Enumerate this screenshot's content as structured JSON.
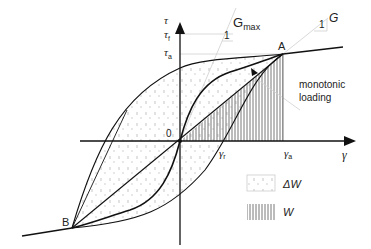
{
  "diagram": {
    "type": "hysteresis-loop",
    "axes": {
      "x_label": "γ",
      "y_label": "τ",
      "origin_label": "0"
    },
    "y_ticks": {
      "tau_f": "τf",
      "tau_a": "τa",
      "tau_f_main": "τ",
      "tau_f_sub": "f",
      "tau_a_main": "τ",
      "tau_a_sub": "a"
    },
    "x_ticks": {
      "gamma_r_main": "γ",
      "gamma_r_sub": "r",
      "gamma_a_main": "γ",
      "gamma_a_sub": "a"
    },
    "points": {
      "A": "A",
      "B": "B"
    },
    "slopes": {
      "gmax_main": "G",
      "gmax_sub": "max",
      "gmax_unit": "1",
      "g_label": "G",
      "g_unit": "1"
    },
    "annotations": {
      "monotonic_line1": "monotonic",
      "monotonic_line2": "loading"
    },
    "legend": {
      "items": [
        {
          "label": "ΔW",
          "pattern": "dotted"
        },
        {
          "label": "W",
          "pattern": "vertical-hatch"
        }
      ]
    },
    "colors": {
      "curve": "#111111",
      "guide": "#c8c8c8",
      "hatch": "#555555"
    }
  }
}
